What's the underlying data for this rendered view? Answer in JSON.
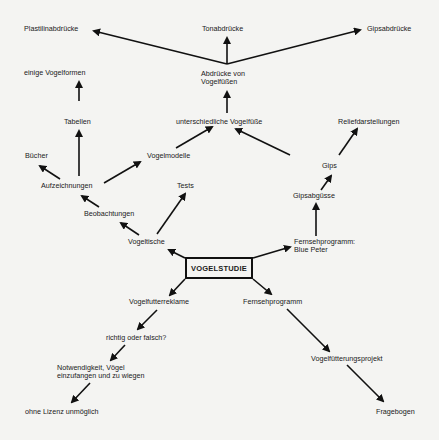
{
  "diagram": {
    "center": "VOGELSTUDIE",
    "nodes": {
      "plastilin": "Plastilinabdrücke",
      "ton": "Tonabdrücke",
      "gipsabdruecke": "Gipsabdrücke",
      "abdruecke_l1": "Abdrücke von",
      "abdruecke_l2": "Vogelfüßen",
      "einige_vogelformen": "einige Vogelformen",
      "tabellen": "Tabellen",
      "unterschiedliche": "unterschiedliche Vogelfüße",
      "relief": "Reliefdarstellungen",
      "buecher": "Bücher",
      "vogelmodelle": "Vogelmodelle",
      "aufzeichnungen": "Aufzeichnungen",
      "tests": "Tests",
      "gips": "Gips",
      "beobachtungen": "Beobachtungen",
      "gipsabguesse": "Gipsabgüsse",
      "vogeltische": "Vogeltische",
      "fernseh_bp_l1": "Fernsehprogramm:",
      "fernseh_bp_l2": "Blue Peter",
      "vogelfutterreklame": "Vogelfutterreklame",
      "fernsehprogramm": "Fernsehprogramm",
      "richtig": "richtig oder falsch?",
      "notwendigkeit_l1": "Notwendigkeit, Vögel",
      "notwendigkeit_l2": "einzufangen und zu wiegen",
      "vogelfuetterung": "Vogelfütterungsprojekt",
      "ohne_lizenz": "ohne Lizenz unmöglich",
      "fragebogen": "Fragebogen"
    },
    "edges": [
      [
        "VOGELSTUDIE",
        "Vogeltische"
      ],
      [
        "VOGELSTUDIE",
        "Fernsehprogramm: Blue Peter"
      ],
      [
        "VOGELSTUDIE",
        "Vogelfutterreklame"
      ],
      [
        "VOGELSTUDIE",
        "Fernsehprogramm"
      ],
      [
        "Vogeltische",
        "Beobachtungen"
      ],
      [
        "Vogeltische",
        "Tests"
      ],
      [
        "Beobachtungen",
        "Aufzeichnungen"
      ],
      [
        "Aufzeichnungen",
        "Bücher"
      ],
      [
        "Aufzeichnungen",
        "Tabellen"
      ],
      [
        "Aufzeichnungen",
        "Vogelmodelle"
      ],
      [
        "Tabellen",
        "einige Vogelformen"
      ],
      [
        "Vogelmodelle",
        "unterschiedliche Vogelfüße"
      ],
      [
        "Gips",
        "unterschiedliche Vogelfüße"
      ],
      [
        "Gips",
        "Reliefdarstellungen"
      ],
      [
        "Gipsabgüsse",
        "Gips"
      ],
      [
        "Fernsehprogramm: Blue Peter",
        "Gipsabgüsse"
      ],
      [
        "unterschiedliche Vogelfüße",
        "Abdrücke von Vogelfüßen"
      ],
      [
        "Abdrücke von Vogelfüßen",
        "Plastilinabdrücke"
      ],
      [
        "Abdrücke von Vogelfüßen",
        "Tonabdrücke"
      ],
      [
        "Abdrücke von Vogelfüßen",
        "Gipsabdrücke"
      ],
      [
        "Vogelfutterreklame",
        "richtig oder falsch?"
      ],
      [
        "richtig oder falsch?",
        "Notwendigkeit, Vögel einzufangen und zu wiegen"
      ],
      [
        "Notwendigkeit, Vögel einzufangen und zu wiegen",
        "ohne Lizenz unmöglich"
      ],
      [
        "Fernsehprogramm",
        "Vogelfütterungsprojekt"
      ],
      [
        "Vogelfütterungsprojekt",
        "Fragebogen"
      ]
    ]
  }
}
